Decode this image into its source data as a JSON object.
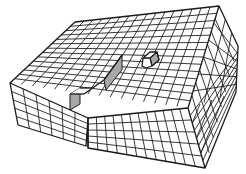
{
  "figure": {
    "title": "Isometric grid block with raised step and small cube",
    "colors": {
      "line": "#1a1a1a",
      "background": "#ffffff",
      "shaded_face": "#a8a8a8"
    },
    "grid": {
      "top_rows": 14,
      "top_cols": 16,
      "right_face_cols": 6,
      "front_rows": 5,
      "front_cols": 12,
      "left_front_rows": 5,
      "left_front_cols": 6
    },
    "features": [
      {
        "name": "raised-step",
        "description": "L-shaped raised ridge with shaded side faces"
      },
      {
        "name": "small-cube",
        "description": "Small cube sitting on top face with shaded side"
      }
    ]
  }
}
